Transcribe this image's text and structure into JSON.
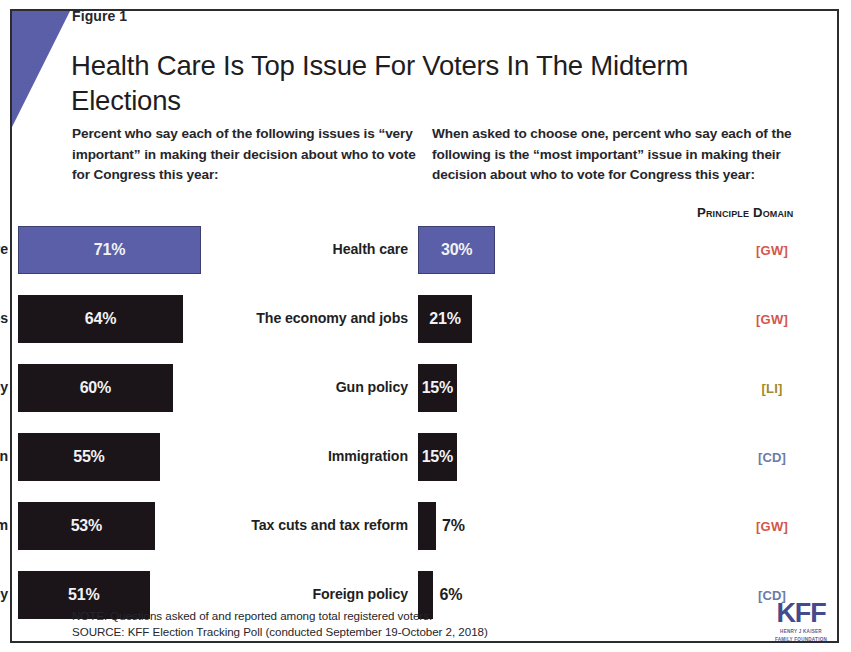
{
  "figure": {
    "label": "Figure 1",
    "title": "Health Care Is Top Issue For Voters In The Midterm Elections"
  },
  "panels": {
    "left_subhead": "Percent who say each of the following issues is “very important” in making their decision about who to vote for Congress this year:",
    "right_subhead": "When asked to choose one, percent who say each of the following is the “most important” issue in making their decision about who to vote for Congress this year:"
  },
  "domain_column": {
    "header": "Principle Domain",
    "tags": [
      {
        "label": "[GW]",
        "color": "#d4574a"
      },
      {
        "label": "[GW]",
        "color": "#d4574a"
      },
      {
        "label": "[LI]",
        "color": "#a08a2e"
      },
      {
        "label": "[CD]",
        "color": "#6b7ba8"
      },
      {
        "label": "[GW]",
        "color": "#d4574a"
      },
      {
        "label": "[CD]",
        "color": "#6b7ba8"
      }
    ]
  },
  "footnotes": {
    "note": "NOTE: Questions asked of and reported among total registered voters.",
    "source": "SOURCE: KFF Election Tracking Poll (conducted September 19-October 2, 2018)"
  },
  "logo": {
    "mark": "KFF",
    "line1": "HENRY J KAISER",
    "line2": "FAMILY FOUNDATION"
  },
  "colors": {
    "highlight_bar": "#5a5fa7",
    "default_bar": "#1b1419",
    "accent_wedge": "#5a5fa7"
  },
  "chart_data": [
    {
      "type": "bar",
      "orientation": "horizontal",
      "panel": "left",
      "title": "Percent who say each of the following issues is “very important” in making their decision about who to vote for Congress this year:",
      "xlabel": "",
      "ylabel": "",
      "xlim": [
        0,
        100
      ],
      "grid": false,
      "legend": "none",
      "categories": [
        "Health care",
        "The economy and jobs",
        "Gun policy",
        "Immigration",
        "Tax cuts and tax reform",
        "Foreign policy"
      ],
      "values": [
        71,
        64,
        60,
        55,
        53,
        51
      ],
      "value_labels": [
        "71%",
        "64%",
        "60%",
        "55%",
        "53%",
        "51%"
      ],
      "highlighted_index": 0
    },
    {
      "type": "bar",
      "orientation": "horizontal",
      "panel": "right",
      "title": "When asked to choose one, percent who say each of the following is the “most important” issue in making their decision about who to vote for Congress this year:",
      "xlabel": "",
      "ylabel": "",
      "xlim": [
        0,
        100
      ],
      "grid": false,
      "legend": "none",
      "categories": [
        "Health care",
        "The economy and jobs",
        "Gun policy",
        "Immigration",
        "Tax cuts and tax reform",
        "Foreign policy"
      ],
      "values": [
        30,
        21,
        15,
        15,
        7,
        6
      ],
      "value_labels": [
        "30%",
        "21%",
        "15%",
        "15%",
        "7%",
        "6%"
      ],
      "highlighted_index": 0
    }
  ]
}
